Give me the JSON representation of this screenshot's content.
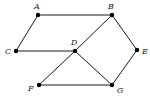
{
  "graph": {
    "nodes": [
      {
        "id": "A",
        "label": "A",
        "x": 38,
        "y": 15,
        "lx": 34,
        "ly": 9
      },
      {
        "id": "B",
        "label": "B",
        "x": 112,
        "y": 15,
        "lx": 108,
        "ly": 9
      },
      {
        "id": "C",
        "label": "C",
        "x": 16,
        "y": 51,
        "lx": 5,
        "ly": 54
      },
      {
        "id": "D",
        "label": "D",
        "x": 75,
        "y": 51,
        "lx": 71,
        "ly": 45
      },
      {
        "id": "E",
        "label": "E",
        "x": 137,
        "y": 50,
        "lx": 142,
        "ly": 54
      },
      {
        "id": "F",
        "label": "F",
        "x": 39,
        "y": 85,
        "lx": 28,
        "ly": 91
      },
      {
        "id": "G",
        "label": "G",
        "x": 112,
        "y": 85,
        "lx": 117,
        "ly": 93
      }
    ],
    "edges": [
      [
        "A",
        "B"
      ],
      [
        "A",
        "C"
      ],
      [
        "C",
        "D"
      ],
      [
        "B",
        "D"
      ],
      [
        "B",
        "E"
      ],
      [
        "D",
        "F"
      ],
      [
        "D",
        "G"
      ],
      [
        "E",
        "G"
      ],
      [
        "F",
        "G"
      ]
    ]
  }
}
